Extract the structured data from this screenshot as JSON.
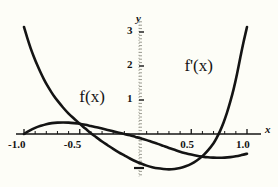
{
  "chart_data": {
    "type": "line",
    "title": "",
    "xlabel": "x",
    "ylabel": "y",
    "xlim": [
      -1.05,
      1.05
    ],
    "ylim": [
      -1.25,
      3.35
    ],
    "grid": false,
    "legend": "inline-annotations",
    "xticks": [
      -1.0,
      -0.5,
      0.5,
      1.0
    ],
    "xticklabels": [
      "-1.0",
      "-0.5",
      "0.5",
      "1.0"
    ],
    "yticks": [
      1,
      2,
      3
    ],
    "yticklabels": [
      "1",
      "2",
      "3"
    ],
    "minor_ticks": true,
    "annotations": [
      {
        "text": "f(x)",
        "x": -0.36,
        "y": 1.02
      },
      {
        "text": "f'(x)",
        "x": 0.6,
        "y": 1.95
      }
    ],
    "series": [
      {
        "name": "f(x)",
        "label": "f(x)",
        "color": "#141414",
        "x": [
          -1.0,
          -0.95,
          -0.9,
          -0.85,
          -0.8,
          -0.75,
          -0.7,
          -0.65,
          -0.6,
          -0.55,
          -0.5,
          -0.45,
          -0.4,
          -0.35,
          -0.3,
          -0.25,
          -0.2,
          -0.15,
          -0.1,
          -0.05,
          0.0,
          0.05,
          0.1,
          0.15,
          0.2,
          0.25,
          0.3,
          0.35,
          0.4,
          0.45,
          0.5,
          0.55,
          0.6,
          0.65,
          0.7,
          0.75,
          0.8,
          0.85,
          0.9,
          0.95,
          1.0
        ],
        "y": [
          0.0,
          0.1,
          0.18,
          0.24,
          0.29,
          0.32,
          0.335,
          0.34,
          0.335,
          0.32,
          0.3,
          0.27,
          0.235,
          0.2,
          0.16,
          0.12,
          0.08,
          0.04,
          0.0,
          -0.04,
          -0.085,
          -0.13,
          -0.18,
          -0.235,
          -0.29,
          -0.35,
          -0.41,
          -0.465,
          -0.52,
          -0.565,
          -0.605,
          -0.64,
          -0.665,
          -0.685,
          -0.695,
          -0.7,
          -0.695,
          -0.68,
          -0.655,
          -0.62,
          -0.58
        ]
      },
      {
        "name": "f'(x)",
        "label": "f'(x)",
        "color": "#141414",
        "x": [
          -1.0,
          -0.97,
          -0.94,
          -0.91,
          -0.88,
          -0.85,
          -0.82,
          -0.79,
          -0.76,
          -0.73,
          -0.7,
          -0.65,
          -0.6,
          -0.55,
          -0.5,
          -0.45,
          -0.4,
          -0.35,
          -0.3,
          -0.25,
          -0.2,
          -0.15,
          -0.1,
          -0.05,
          0.0,
          0.05,
          0.1,
          0.15,
          0.2,
          0.25,
          0.3,
          0.35,
          0.4,
          0.45,
          0.5,
          0.55,
          0.6,
          0.65,
          0.7,
          0.73,
          0.76,
          0.79,
          0.82,
          0.85,
          0.88,
          0.91,
          0.94,
          0.97,
          1.0
        ],
        "y": [
          3.15,
          2.82,
          2.52,
          2.26,
          2.02,
          1.8,
          1.6,
          1.42,
          1.26,
          1.11,
          0.98,
          0.78,
          0.6,
          0.45,
          0.3,
          0.16,
          0.02,
          -0.1,
          -0.22,
          -0.33,
          -0.44,
          -0.54,
          -0.63,
          -0.72,
          -0.8,
          -0.87,
          -0.93,
          -0.975,
          -1.01,
          -1.03,
          -1.04,
          -1.03,
          -1.0,
          -0.95,
          -0.88,
          -0.78,
          -0.65,
          -0.48,
          -0.27,
          -0.1,
          0.1,
          0.34,
          0.62,
          0.95,
          1.32,
          1.76,
          2.25,
          2.72,
          3.15
        ]
      }
    ]
  },
  "axes": {
    "x_axis_name": "x",
    "y_axis_name": "y"
  },
  "colors": {
    "background": "#fdfdf7",
    "curve": "#141414",
    "axis": "#141414",
    "axis_dotted": "#b9b9ad",
    "text": "#141414"
  }
}
